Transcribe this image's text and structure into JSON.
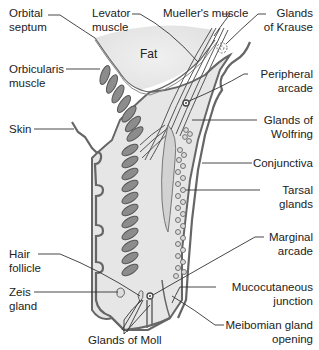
{
  "diagram": {
    "type": "anatomical cross-section",
    "inline_text": {
      "fat": "Fat"
    },
    "labels_left": [
      {
        "id": "orbital-septum",
        "lines": [
          "Orbital",
          "septum"
        ]
      },
      {
        "id": "orbicularis-muscle",
        "lines": [
          "Orbicularis",
          "muscle"
        ]
      },
      {
        "id": "skin",
        "lines": [
          "Skin"
        ]
      },
      {
        "id": "hair-follicle",
        "lines": [
          "Hair",
          "follicle"
        ]
      },
      {
        "id": "zeis-gland",
        "lines": [
          "Zeis",
          "gland"
        ]
      }
    ],
    "labels_top": [
      {
        "id": "levator-muscle",
        "lines": [
          "Levator",
          "muscle"
        ]
      },
      {
        "id": "muellers-muscle",
        "lines": [
          "Mueller's muscle"
        ]
      }
    ],
    "labels_right": [
      {
        "id": "glands-of-krause",
        "lines": [
          "Glands",
          "of Krause"
        ]
      },
      {
        "id": "peripheral-arcade",
        "lines": [
          "Peripheral",
          "arcade"
        ]
      },
      {
        "id": "glands-of-wolfring",
        "lines": [
          "Glands of",
          "Wolfring"
        ]
      },
      {
        "id": "conjunctiva",
        "lines": [
          "Conjunctiva"
        ]
      },
      {
        "id": "tarsal-glands",
        "lines": [
          "Tarsal",
          "glands"
        ]
      },
      {
        "id": "marginal-arcade",
        "lines": [
          "Marginal",
          "arcade"
        ]
      },
      {
        "id": "mucocutaneous-junction",
        "lines": [
          "Mucocutaneous",
          "junction"
        ]
      },
      {
        "id": "meibomian-gland-opening",
        "lines": [
          "Meibomian gland",
          "opening"
        ]
      }
    ],
    "labels_bottom": [
      {
        "id": "glands-of-moll",
        "lines": [
          "Glands of Moll"
        ]
      }
    ],
    "colors": {
      "tissue_fill": "#e4e4e4",
      "fat_fill": "#eeeeee",
      "muscle_fill": "#8a8a8a",
      "outline": "#555555",
      "leader_line": "#333333"
    }
  }
}
